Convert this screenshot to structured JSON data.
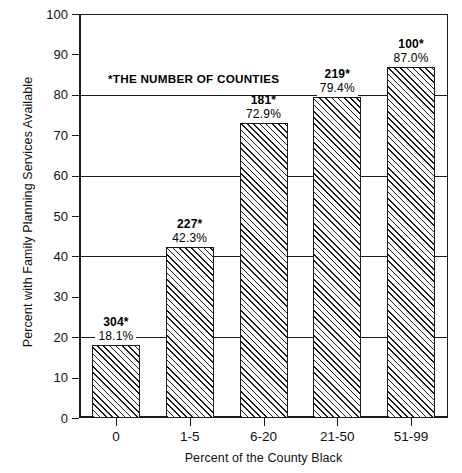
{
  "chart_data": {
    "type": "bar",
    "title": "",
    "xlabel": "Percent of the County Black",
    "ylabel": "Percent with Family Planning Services Available",
    "categories": [
      "0",
      "1-5",
      "6-20",
      "21-50",
      "51-99"
    ],
    "values": [
      18.1,
      42.3,
      72.9,
      79.4,
      87.0
    ],
    "value_labels": [
      "18.1%",
      "42.3%",
      "72.9%",
      "79.4%",
      "87.0%"
    ],
    "counts": [
      304,
      227,
      181,
      219,
      100
    ],
    "count_labels": [
      "304*",
      "227*",
      "181*",
      "219*",
      "100*"
    ],
    "ylim": [
      0,
      100
    ],
    "yticks": [
      0,
      10,
      20,
      30,
      40,
      50,
      60,
      70,
      80,
      90,
      100
    ],
    "ytick_labels": [
      "0",
      "10",
      "20",
      "30",
      "40",
      "50",
      "60",
      "70",
      "80",
      "90",
      "100"
    ],
    "gridlines": [
      20,
      40,
      60,
      80
    ],
    "grid": true,
    "legend": "none",
    "annotation": "*THE NUMBER OF COUNTIES",
    "bar_fill": "diagonal-hatch",
    "colors": {
      "axis": "#1a1a1a",
      "bar_edge": "#1a1a1a",
      "bar_hatch": "#1a1a1a",
      "background": "#ffffff",
      "text": "#000000"
    }
  }
}
